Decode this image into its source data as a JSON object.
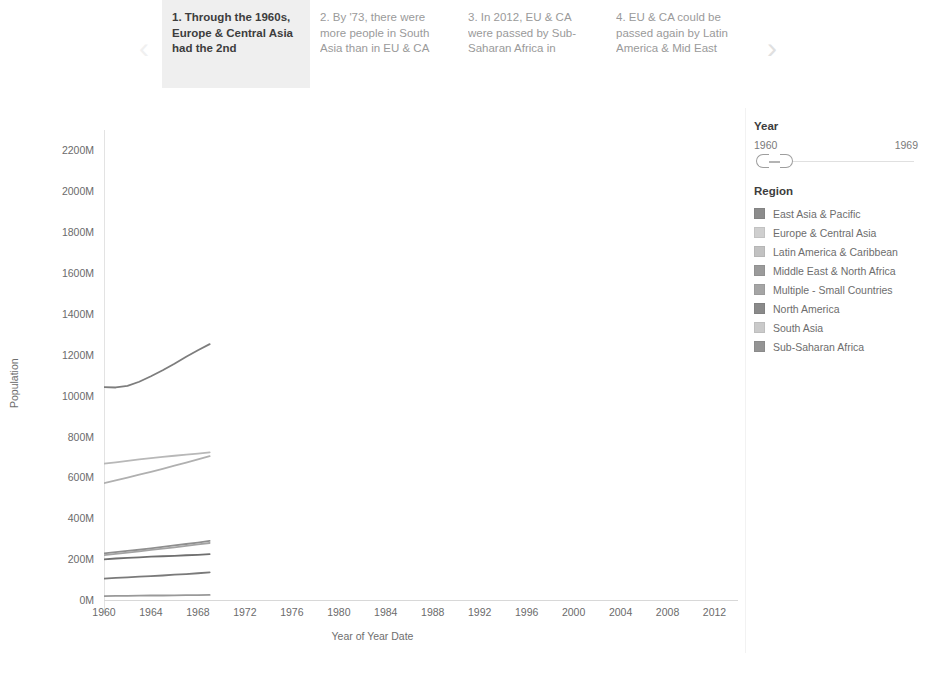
{
  "story": {
    "prev_icon": "chevron-left-icon",
    "next_icon": "chevron-right-icon",
    "prev_glyph": "‹",
    "next_glyph": "›",
    "cards": [
      {
        "text": "1. Through the 1960s, Europe & Central Asia had the 2nd",
        "active": true
      },
      {
        "text": "2. By '73, there were more people in South Asia than in EU & CA",
        "active": false
      },
      {
        "text": "3. In 2012, EU & CA were passed by Sub-Saharan Africa in",
        "active": false
      },
      {
        "text": "4. EU & CA could be passed again by Latin America & Mid East",
        "active": false
      }
    ]
  },
  "legend": {
    "year": {
      "title": "Year",
      "min_label": "1960",
      "max_label": "1969"
    },
    "region": {
      "title": "Region",
      "items": [
        {
          "label": "East Asia & Pacific",
          "color": "#8c8c8c"
        },
        {
          "label": "Europe & Central Asia",
          "color": "#cfcfcf"
        },
        {
          "label": "Latin America & Caribbean",
          "color": "#c2c2c2"
        },
        {
          "label": "Middle East & North Africa",
          "color": "#9b9b9b"
        },
        {
          "label": "Multiple - Small Countries",
          "color": "#a5a5a5"
        },
        {
          "label": "North America",
          "color": "#8a8a8a"
        },
        {
          "label": "South Asia",
          "color": "#cacaca"
        },
        {
          "label": "Sub-Saharan Africa",
          "color": "#949494"
        }
      ]
    }
  },
  "chart_data": {
    "type": "line",
    "title": "",
    "xlabel": "Year of Year Date",
    "ylabel": "Population",
    "xlim": [
      1960,
      2014
    ],
    "ylim": [
      0,
      2300
    ],
    "y_unit": "M",
    "grid": false,
    "legend_position": "right",
    "x_ticks": [
      1960,
      1964,
      1968,
      1972,
      1976,
      1980,
      1984,
      1988,
      1992,
      1996,
      2000,
      2004,
      2008,
      2012
    ],
    "y_ticks": [
      0,
      200,
      400,
      600,
      800,
      1000,
      1200,
      1400,
      1600,
      1800,
      2000,
      2200
    ],
    "y_tick_labels": [
      "0M",
      "200M",
      "400M",
      "600M",
      "800M",
      "1000M",
      "1200M",
      "1400M",
      "1600M",
      "1800M",
      "2000M",
      "2200M"
    ],
    "x": [
      1960,
      1961,
      1962,
      1963,
      1964,
      1965,
      1966,
      1967,
      1968,
      1969
    ],
    "series": [
      {
        "name": "East Asia & Pacific",
        "color": "#7d7d7d",
        "values": [
          1042,
          1040,
          1048,
          1068,
          1095,
          1124,
          1156,
          1190,
          1222,
          1252
        ]
      },
      {
        "name": "Europe & Central Asia",
        "color": "#b8b8b8",
        "values": [
          667,
          674,
          681,
          688,
          694,
          700,
          706,
          711,
          716,
          722
        ]
      },
      {
        "name": "South Asia",
        "color": "#b0b0b0",
        "values": [
          572,
          585,
          599,
          613,
          627,
          642,
          657,
          672,
          688,
          704
        ]
      },
      {
        "name": "Sub-Saharan Africa",
        "color": "#8f8f8f",
        "values": [
          228,
          234,
          240,
          246,
          253,
          260,
          267,
          274,
          281,
          289
        ]
      },
      {
        "name": "Latin America & Caribbean",
        "color": "#a3a3a3",
        "values": [
          220,
          226,
          232,
          238,
          245,
          251,
          258,
          265,
          272,
          279
        ]
      },
      {
        "name": "North America",
        "color": "#6f6f6f",
        "values": [
          199,
          203,
          206,
          209,
          212,
          214,
          216,
          219,
          221,
          224
        ]
      },
      {
        "name": "Middle East & North Africa",
        "color": "#7a7a7a",
        "values": [
          105,
          108,
          111,
          114,
          117,
          120,
          124,
          127,
          131,
          135
        ]
      },
      {
        "name": "Multiple - Small Countries",
        "color": "#999999",
        "values": [
          19,
          20,
          20,
          21,
          22,
          22,
          23,
          24,
          24,
          25
        ]
      }
    ]
  }
}
